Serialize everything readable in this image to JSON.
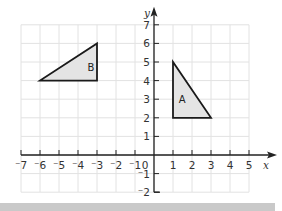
{
  "chart_data": {
    "type": "scatter",
    "title": "",
    "xlabel": "x",
    "ylabel": "y",
    "xlim": [
      -7,
      5
    ],
    "ylim": [
      -2,
      7
    ],
    "grid": true,
    "x_ticks": [
      "-7",
      "-6",
      "-5",
      "-4",
      "-3",
      "-2",
      "-1",
      "0",
      "1",
      "2",
      "3",
      "4",
      "5"
    ],
    "y_ticks": [
      "-2",
      "-1",
      "1",
      "2",
      "3",
      "4",
      "5",
      "6",
      "7"
    ],
    "shapes": [
      {
        "name": "A",
        "type": "triangle",
        "vertices": [
          [
            1,
            5
          ],
          [
            1,
            2
          ],
          [
            3,
            2
          ]
        ],
        "fill": "#e4e4e4",
        "label_pos": [
          1.3,
          2.8
        ]
      },
      {
        "name": "B",
        "type": "triangle",
        "vertices": [
          [
            -6,
            4
          ],
          [
            -3,
            4
          ],
          [
            -3,
            6
          ]
        ],
        "fill": "#e4e4e4",
        "label_pos": [
          -3.5,
          4.5
        ]
      }
    ]
  },
  "colors": {
    "grid": "#e2e2e2",
    "axis": "#222222",
    "shape_stroke": "#1a1a1a",
    "shape_fill": "#e4e4e4",
    "bottom_band": "#c9c9c9"
  }
}
